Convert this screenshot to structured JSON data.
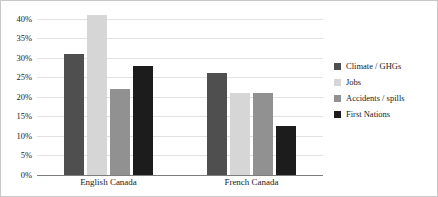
{
  "chart_data": {
    "type": "bar",
    "title": "",
    "subtitle": "",
    "xlabel": "",
    "ylabel": "",
    "orientation": "vertical",
    "grouping": "clustered",
    "categories": [
      "English Canada",
      "French Canada"
    ],
    "series": [
      {
        "name": "Climate / GHGs",
        "color": "#4f4f4f",
        "values": [
          31,
          26
        ]
      },
      {
        "name": "Jobs",
        "color": "#d6d6d6",
        "values": [
          41,
          21
        ]
      },
      {
        "name": "Accidents / spills",
        "color": "#919191",
        "values": [
          22,
          21
        ]
      },
      {
        "name": "First Nations",
        "color": "#1c1c1c",
        "values": [
          28,
          12.5
        ]
      }
    ],
    "ylim": [
      0,
      42.5
    ],
    "yticks": [
      0,
      5,
      10,
      15,
      20,
      25,
      30,
      35,
      40
    ],
    "ytick_labels": [
      "0%",
      "5%",
      "10%",
      "15%",
      "20%",
      "25%",
      "30%",
      "35%",
      "40%"
    ],
    "value_suffix": "%",
    "grid": {
      "horizontal": true,
      "vertical": false,
      "color": "#e2e2e2"
    },
    "axis_line_color": "#7d7d7d",
    "legend": {
      "position": "right",
      "entries": [
        {
          "label": "Climate / GHGs",
          "color": "#4f4f4f"
        },
        {
          "label": "Jobs",
          "color": "#d6d6d6"
        },
        {
          "label": "Accidents / spills",
          "color": "#919191"
        },
        {
          "label": "First Nations",
          "color": "#1c1c1c"
        }
      ]
    },
    "frame": {
      "border_color": "#c8c8c8",
      "background": "#ffffff"
    }
  }
}
